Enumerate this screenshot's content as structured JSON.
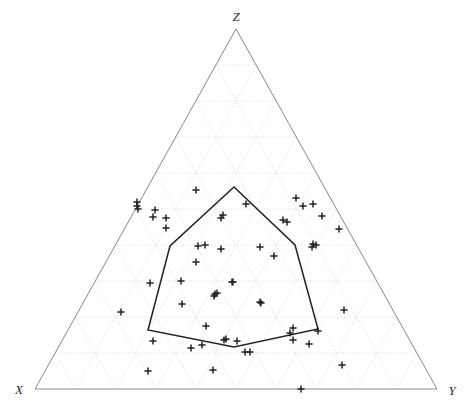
{
  "figure": {
    "type": "ternary-scatter-plot",
    "background": "#ffffff",
    "width": 464,
    "height": 411
  },
  "labels": {
    "apex_top": "Z",
    "corner_left": "X",
    "corner_right": "Y"
  },
  "style": {
    "axis_color": "#888888",
    "grid_color": "#cfcfcf",
    "marker_color": "#222222",
    "hull_color": "#222222",
    "label_color": "#2b2b2b"
  },
  "chart_data": {
    "type": "scatter",
    "title": "",
    "xlabel": "X",
    "ylabel": "Y",
    "zlabel": "Z",
    "grid": true,
    "grid_divisions": 10,
    "legend": "none",
    "axis_ranges": {
      "X": [
        0,
        1
      ],
      "Y": [
        0,
        1
      ],
      "Z": [
        0,
        1
      ]
    },
    "triangle_vertices_px": {
      "top": [
        236,
        29
      ],
      "bottom_left": [
        35,
        389
      ],
      "bottom_right": [
        437,
        389
      ]
    },
    "marker_symbol": "plus",
    "points_px": [
      [
        137,
        202
      ],
      [
        137,
        206
      ],
      [
        138,
        209
      ],
      [
        155,
        210
      ],
      [
        153,
        217
      ],
      [
        166,
        218
      ],
      [
        196,
        190
      ],
      [
        223,
        215
      ],
      [
        246,
        204
      ],
      [
        221,
        218
      ],
      [
        166,
        228
      ],
      [
        198,
        246
      ],
      [
        205,
        245
      ],
      [
        196,
        262
      ],
      [
        221,
        249
      ],
      [
        260,
        247
      ],
      [
        274,
        256
      ],
      [
        296,
        198
      ],
      [
        303,
        206
      ],
      [
        313,
        204
      ],
      [
        322,
        216
      ],
      [
        287,
        222
      ],
      [
        283,
        220
      ],
      [
        313,
        244
      ],
      [
        316,
        245
      ],
      [
        312,
        247
      ],
      [
        339,
        229
      ],
      [
        181,
        281
      ],
      [
        232,
        282
      ],
      [
        233,
        282
      ],
      [
        215,
        294
      ],
      [
        217,
        293
      ],
      [
        214,
        296
      ],
      [
        150,
        283
      ],
      [
        182,
        304
      ],
      [
        260,
        302
      ],
      [
        344,
        310
      ],
      [
        121,
        312
      ],
      [
        206,
        326
      ],
      [
        226,
        339
      ],
      [
        237,
        341
      ],
      [
        245,
        352
      ],
      [
        250,
        352
      ],
      [
        153,
        341
      ],
      [
        191,
        348
      ],
      [
        202,
        345
      ],
      [
        290,
        333
      ],
      [
        293,
        328
      ],
      [
        309,
        344
      ],
      [
        148,
        371
      ],
      [
        213,
        370
      ],
      [
        342,
        365
      ],
      [
        301,
        389
      ],
      [
        224,
        340
      ],
      [
        293,
        340
      ],
      [
        318,
        331
      ],
      [
        261,
        303
      ]
    ],
    "hull_polygon_px": [
      [
        234,
        187
      ],
      [
        295,
        245
      ],
      [
        318,
        329
      ],
      [
        234,
        347
      ],
      [
        148,
        330
      ],
      [
        170,
        246
      ]
    ],
    "hull_closed": true,
    "n_points": 57
  }
}
